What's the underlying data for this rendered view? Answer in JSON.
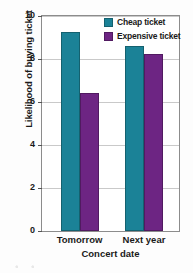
{
  "chart_data": {
    "type": "bar",
    "title": "",
    "xlabel": "Concert date",
    "ylabel": "Likelihood of buying ticket",
    "categories": [
      "Tomorrow",
      "Next year"
    ],
    "series": [
      {
        "name": "Cheap ticket",
        "color": "#1b8297",
        "values": [
          9.25,
          8.6
        ]
      },
      {
        "name": "Expensive ticket",
        "color": "#6d2583",
        "values": [
          6.4,
          8.25
        ]
      }
    ],
    "ylim": [
      0,
      10
    ],
    "yticks": [
      0,
      2,
      4,
      6,
      8,
      10
    ],
    "ytick_labels": [
      "0",
      "2",
      "4",
      "6",
      "8",
      "10"
    ],
    "grid": true,
    "legend_position": "top-right"
  },
  "legend": {
    "items": [
      {
        "label": "Cheap ticket",
        "color": "#1b8297"
      },
      {
        "label": "Expensive ticket",
        "color": "#6d2583"
      }
    ]
  },
  "axis": {
    "y_title": "Likelihood of buying ticket",
    "x_title": "Concert date",
    "y_ticks": [
      "0",
      "2",
      "4",
      "6",
      "8",
      "10"
    ],
    "x_ticks": [
      "Tomorrow",
      "Next year"
    ]
  }
}
